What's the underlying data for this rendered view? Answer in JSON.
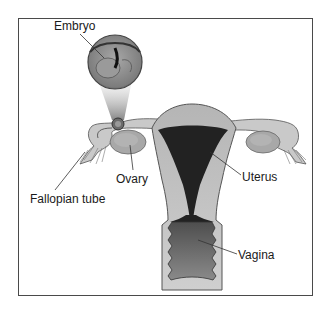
{
  "figure": {
    "labels": {
      "embryo": "Embryo",
      "ovary": "Ovary",
      "fallopian_tube": "Fallopian tube",
      "uterus": "Uterus",
      "vagina": "Vagina"
    },
    "colors": {
      "frame": "#4a4a4a",
      "tissue_light": "#c4c4c4",
      "tissue_mid": "#9a9a9a",
      "cavity_dark": "#1f1f1f",
      "vagina_fill": "#6e6e6e",
      "leader_line": "#333333"
    }
  }
}
